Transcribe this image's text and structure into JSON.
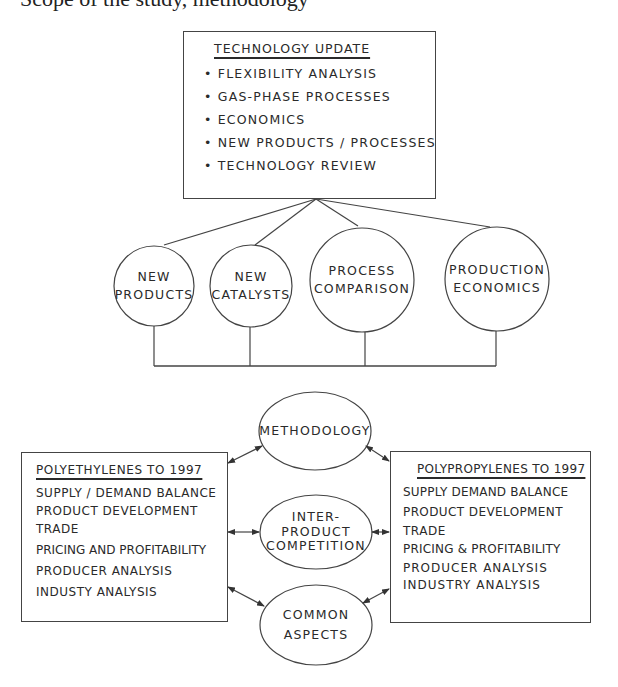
{
  "caption": "Scope of the study, methodology",
  "technology_update": {
    "title": "TECHNOLOGY UPDATE",
    "items": [
      "FLEXIBILITY ANALYSIS",
      "GAS-PHASE PROCESSES",
      "ECONOMICS",
      "NEW PRODUCTS / PROCESSES",
      "TECHNOLOGY REVIEW"
    ]
  },
  "topic_circles": [
    {
      "line1": "NEW",
      "line2": "PRODUCTS"
    },
    {
      "line1": "NEW",
      "line2": "CATALYSTS"
    },
    {
      "line1": "PROCESS",
      "line2": "COMPARISON"
    },
    {
      "line1": "PRODUCTION",
      "line2": "ECONOMICS"
    }
  ],
  "polyethylenes": {
    "title": "POLYETHYLENES TO 1997",
    "items": [
      "SUPPLY / DEMAND BALANCE",
      "PRODUCT DEVELOPMENT",
      "TRADE",
      "PRICING AND PROFITABILITY",
      "PRODUCER ANALYSIS",
      "INDUSTY ANALYSIS"
    ]
  },
  "polypropylenes": {
    "title": "POLYPROPYLENES TO 1997",
    "items": [
      "SUPPLY DEMAND BALANCE",
      "PRODUCT DEVELOPMENT",
      "TRADE",
      "PRICING & PROFITABILITY",
      "PRODUCER ANALYSIS",
      "INDUSTRY ANALYSIS"
    ]
  },
  "center_ellipses": [
    {
      "lines": [
        "METHODOLOGY"
      ]
    },
    {
      "lines": [
        "INTER-",
        "PRODUCT",
        "COMPETITION"
      ]
    },
    {
      "lines": [
        "COMMON",
        "ASPECTS"
      ]
    }
  ]
}
